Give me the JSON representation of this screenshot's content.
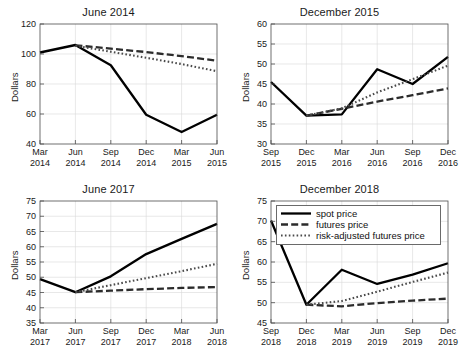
{
  "figure": {
    "suptitle": "",
    "ylabel": "Dollars",
    "background": "#ffffff",
    "series_colors": {
      "spot": "#000000",
      "futures": "#2b2b2b",
      "risk_adjusted": "#4a4a4a"
    }
  },
  "legend": {
    "position": "top-left of bottom-right panel",
    "items": [
      {
        "label": "spot price",
        "style": "solid",
        "key": "spot"
      },
      {
        "label": "futures price",
        "style": "dashed",
        "key": "futures"
      },
      {
        "label": "risk-adjusted futures price",
        "style": "dotted",
        "key": "risk_adjusted"
      }
    ]
  },
  "chart_data": [
    {
      "id": "panel-june-2014",
      "type": "line",
      "title": "June 2014",
      "xlabel": "",
      "ylabel": "Dollars",
      "grid": true,
      "ylim": [
        40,
        120
      ],
      "yticks": [
        40,
        60,
        80,
        100,
        120
      ],
      "categories": [
        "Mar\n2014",
        "Jun\n2014",
        "Sep\n2014",
        "Dec\n2014",
        "Mar\n2015",
        "Jun\n2015"
      ],
      "tick_labels": [
        {
          "top": "Mar",
          "bottom": "2014"
        },
        {
          "top": "Jun",
          "bottom": "2014"
        },
        {
          "top": "Sep",
          "bottom": "2014"
        },
        {
          "top": "Dec",
          "bottom": "2014"
        },
        {
          "top": "Mar",
          "bottom": "2015"
        },
        {
          "top": "Jun",
          "bottom": "2015"
        }
      ],
      "series": [
        {
          "name": "spot price",
          "key": "spot",
          "values": [
            101.0,
            106.0,
            92.5,
            59.5,
            48.0,
            59.5
          ]
        },
        {
          "name": "futures price",
          "key": "futures",
          "values": [
            null,
            105.8,
            103.6,
            101.3,
            98.6,
            95.5
          ]
        },
        {
          "name": "risk-adjusted futures price",
          "key": "risk_adjusted",
          "values": [
            null,
            105.5,
            101.5,
            97.5,
            93.3,
            88.5
          ]
        }
      ]
    },
    {
      "id": "panel-december-2015",
      "type": "line",
      "title": "December 2015",
      "xlabel": "",
      "ylabel": "Dollars",
      "grid": true,
      "ylim": [
        30,
        60
      ],
      "yticks": [
        30,
        35,
        40,
        45,
        50,
        55,
        60
      ],
      "categories": [
        "Sep\n2015",
        "Dec\n2015",
        "Mar\n2016",
        "Jun\n2016",
        "Sep\n2016",
        "Dec\n2016"
      ],
      "tick_labels": [
        {
          "top": "Sep",
          "bottom": "2015"
        },
        {
          "top": "Dec",
          "bottom": "2015"
        },
        {
          "top": "Mar",
          "bottom": "2016"
        },
        {
          "top": "Jun",
          "bottom": "2016"
        },
        {
          "top": "Sep",
          "bottom": "2016"
        },
        {
          "top": "Dec",
          "bottom": "2016"
        }
      ],
      "series": [
        {
          "name": "spot price",
          "key": "spot",
          "values": [
            45.5,
            37.1,
            37.4,
            48.7,
            45.0,
            51.8
          ]
        },
        {
          "name": "futures price",
          "key": "futures",
          "values": [
            null,
            37.1,
            38.8,
            40.6,
            42.2,
            43.9
          ]
        },
        {
          "name": "risk-adjusted futures price",
          "key": "risk_adjusted",
          "values": [
            null,
            37.1,
            38.9,
            42.9,
            46.2,
            49.6
          ]
        }
      ]
    },
    {
      "id": "panel-june-2017",
      "type": "line",
      "title": "June 2017",
      "xlabel": "",
      "ylabel": "Dollars",
      "grid": true,
      "ylim": [
        35,
        75
      ],
      "yticks": [
        35,
        40,
        45,
        50,
        55,
        60,
        65,
        70,
        75
      ],
      "categories": [
        "Mar\n2017",
        "Jun\n2017",
        "Sep\n2017",
        "Dec\n2017",
        "Mar\n2018",
        "Jun\n2018"
      ],
      "tick_labels": [
        {
          "top": "Mar",
          "bottom": "2017"
        },
        {
          "top": "Jun",
          "bottom": "2017"
        },
        {
          "top": "Sep",
          "bottom": "2017"
        },
        {
          "top": "Dec",
          "bottom": "2017"
        },
        {
          "top": "Mar",
          "bottom": "2018"
        },
        {
          "top": "Jun",
          "bottom": "2018"
        }
      ],
      "series": [
        {
          "name": "spot price",
          "key": "spot",
          "values": [
            49.4,
            45.1,
            50.3,
            57.6,
            62.6,
            67.5
          ]
        },
        {
          "name": "futures price",
          "key": "futures",
          "values": [
            null,
            45.1,
            45.6,
            46.1,
            46.5,
            46.8
          ]
        },
        {
          "name": "risk-adjusted futures price",
          "key": "risk_adjusted",
          "values": [
            null,
            45.1,
            47.4,
            49.7,
            52.0,
            54.4
          ]
        }
      ]
    },
    {
      "id": "panel-december-2018",
      "type": "line",
      "title": "December 2018",
      "xlabel": "",
      "ylabel": "Dollars",
      "grid": true,
      "ylim": [
        45,
        75
      ],
      "yticks": [
        45,
        50,
        55,
        60,
        65,
        70,
        75
      ],
      "categories": [
        "Sep\n2018",
        "Dec\n2018",
        "Mar\n2019",
        "Jun\n2019",
        "Sep\n2019",
        "Dec\n2019"
      ],
      "tick_labels": [
        {
          "top": "Sep",
          "bottom": "2018"
        },
        {
          "top": "Dec",
          "bottom": "2018"
        },
        {
          "top": "Mar",
          "bottom": "2019"
        },
        {
          "top": "Jun",
          "bottom": "2019"
        },
        {
          "top": "Sep",
          "bottom": "2019"
        },
        {
          "top": "Dec",
          "bottom": "2019"
        }
      ],
      "series": [
        {
          "name": "spot price",
          "key": "spot",
          "values": [
            70.2,
            49.5,
            58.1,
            54.6,
            56.9,
            59.7
          ]
        },
        {
          "name": "futures price",
          "key": "futures",
          "values": [
            null,
            49.5,
            49.1,
            49.9,
            50.5,
            51.0
          ]
        },
        {
          "name": "risk-adjusted futures price",
          "key": "risk_adjusted",
          "values": [
            null,
            49.5,
            50.4,
            52.7,
            55.1,
            57.4
          ]
        }
      ]
    }
  ]
}
